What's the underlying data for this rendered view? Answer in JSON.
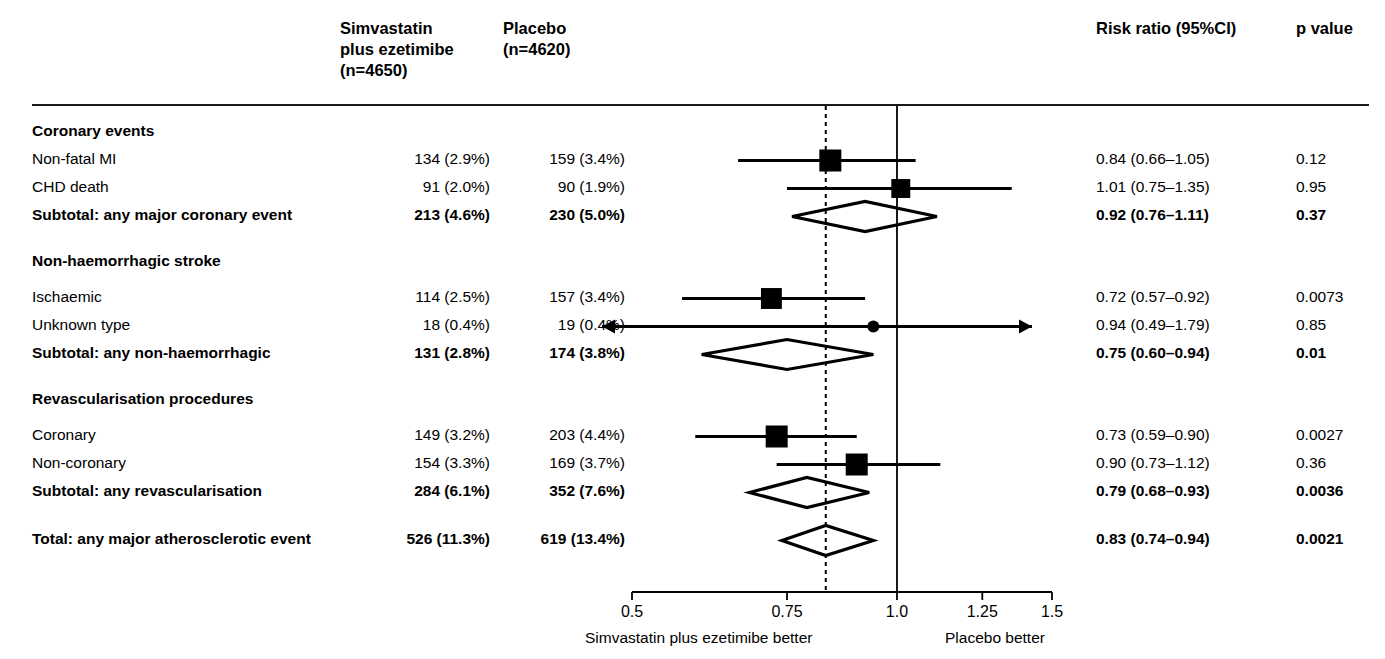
{
  "header": {
    "col_group1": "Simvastatin plus ezetimibe (n=4650)",
    "col_group1_line1": "Simvastatin",
    "col_group1_line2": "plus ezetimibe",
    "col_group1_line3": "(n=4650)",
    "col_group2_line1": "Placebo",
    "col_group2_line2": "(n=4620)",
    "col_rr": "Risk ratio (95%CI)",
    "col_p": "p value"
  },
  "axis": {
    "ticks": [
      "0.5",
      "0.75",
      "1.0",
      "1.25",
      "1.5"
    ],
    "tick_values": [
      0.5,
      0.75,
      1.0,
      1.25,
      1.5
    ],
    "left_label": "Simvastatin plus ezetimibe better",
    "right_label": "Placebo better",
    "reference_line": 1.0,
    "overall_line": 0.83,
    "scale": "log"
  },
  "rows": [
    {
      "type": "section",
      "label": "Coronary events"
    },
    {
      "type": "study",
      "label": "Non-fatal MI",
      "g1": "134 (2.9%)",
      "g2": "159 (3.4%)",
      "rr": "0.84 (0.66–1.05)",
      "p": "0.12",
      "est": 0.84,
      "lo": 0.66,
      "hi": 1.05,
      "size": 1.0
    },
    {
      "type": "study",
      "label": "CHD death",
      "g1": "91 (2.0%)",
      "g2": "90 (1.9%)",
      "rr": "1.01 (0.75–1.35)",
      "p": "0.95",
      "est": 1.01,
      "lo": 0.75,
      "hi": 1.35,
      "size": 0.86
    },
    {
      "type": "subtotal",
      "label": "Subtotal: any major coronary event",
      "g1": "213 (4.6%)",
      "g2": "230 (5.0%)",
      "rr": "0.92 (0.76–1.11)",
      "p": "0.37",
      "est": 0.92,
      "lo": 0.76,
      "hi": 1.11
    },
    {
      "type": "section",
      "label": "Non-haemorrhagic stroke"
    },
    {
      "type": "study",
      "label": "Ischaemic",
      "g1": "114 (2.5%)",
      "g2": "157 (3.4%)",
      "rr": "0.72 (0.57–0.92)",
      "p": "0.0073",
      "est": 0.72,
      "lo": 0.57,
      "hi": 0.92,
      "size": 0.95
    },
    {
      "type": "study",
      "label": "Unknown type",
      "g1": "18 (0.4%)",
      "g2": "19 (0.4%)",
      "rr": "0.94 (0.49–1.79)",
      "p": "0.85",
      "est": 0.94,
      "lo": 0.49,
      "hi": 1.79,
      "size": 0.34,
      "arrows": true
    },
    {
      "type": "subtotal",
      "label": "Subtotal: any non-haemorrhagic",
      "g1": "131 (2.8%)",
      "g2": "174 (3.8%)",
      "rr": "0.75 (0.60–0.94)",
      "p": "0.01",
      "est": 0.75,
      "lo": 0.6,
      "hi": 0.94
    },
    {
      "type": "section",
      "label": "Revascularisation procedures"
    },
    {
      "type": "study",
      "label": "Coronary",
      "g1": "149 (3.2%)",
      "g2": "203 (4.4%)",
      "rr": "0.73 (0.59–0.90)",
      "p": "0.0027",
      "est": 0.73,
      "lo": 0.59,
      "hi": 0.9,
      "size": 1.0
    },
    {
      "type": "study",
      "label": "Non-coronary",
      "g1": "154 (3.3%)",
      "g2": "169 (3.7%)",
      "rr": "0.90 (0.73–1.12)",
      "p": "0.36",
      "est": 0.9,
      "lo": 0.73,
      "hi": 1.12,
      "size": 1.0
    },
    {
      "type": "subtotal",
      "label": "Subtotal: any revascularisation",
      "g1": "284 (6.1%)",
      "g2": "352 (7.6%)",
      "rr": "0.79 (0.68–0.93)",
      "p": "0.0036",
      "est": 0.79,
      "lo": 0.68,
      "hi": 0.93
    },
    {
      "type": "spacer"
    },
    {
      "type": "total",
      "label": "Total: any major atherosclerotic event",
      "g1": "526 (11.3%)",
      "g2": "619 (13.4%)",
      "rr": "0.83 (0.74–0.94)",
      "p": "0.0021",
      "est": 0.83,
      "lo": 0.74,
      "hi": 0.94
    }
  ],
  "chart_data": {
    "type": "scatter",
    "title": "",
    "xlabel": "Risk ratio (95%CI)",
    "ylabel": "",
    "xlim": [
      0.5,
      1.5
    ],
    "xscale": "log",
    "xticks": [
      0.5,
      0.75,
      1.0,
      1.25,
      1.5
    ],
    "grid": false,
    "legend": "none",
    "reference_line": 1.0,
    "overall_dotted_line": 0.83,
    "annotations": [
      "Simvastatin plus ezetimibe better",
      "Placebo better"
    ],
    "categories": [
      "Non-fatal MI",
      "CHD death",
      "Subtotal: any major coronary event",
      "Ischaemic",
      "Unknown type",
      "Subtotal: any non-haemorrhagic",
      "Coronary",
      "Non-coronary",
      "Subtotal: any revascularisation",
      "Total: any major atherosclerotic event"
    ],
    "estimates": [
      0.84,
      1.01,
      0.92,
      0.72,
      0.94,
      0.75,
      0.73,
      0.9,
      0.79,
      0.83
    ],
    "ci_low": [
      0.66,
      0.75,
      0.76,
      0.57,
      0.49,
      0.6,
      0.59,
      0.73,
      0.68,
      0.74
    ],
    "ci_high": [
      1.05,
      1.35,
      1.11,
      0.92,
      1.79,
      0.94,
      0.9,
      1.12,
      0.93,
      0.94
    ],
    "p_values": [
      "0.12",
      "0.95",
      "0.37",
      "0.0073",
      "0.85",
      "0.01",
      "0.0027",
      "0.36",
      "0.0036",
      "0.0021"
    ],
    "events_treatment": [
      134,
      91,
      213,
      114,
      18,
      131,
      149,
      154,
      284,
      526
    ],
    "pct_treatment": [
      2.9,
      2.0,
      4.6,
      2.5,
      0.4,
      2.8,
      3.2,
      3.3,
      6.1,
      11.3
    ],
    "events_control": [
      159,
      90,
      230,
      157,
      19,
      174,
      203,
      169,
      352,
      619
    ],
    "pct_control": [
      3.4,
      1.9,
      5.0,
      3.4,
      0.4,
      3.8,
      4.4,
      3.7,
      7.6,
      13.4
    ],
    "n_treatment": 4650,
    "n_control": 4620
  }
}
